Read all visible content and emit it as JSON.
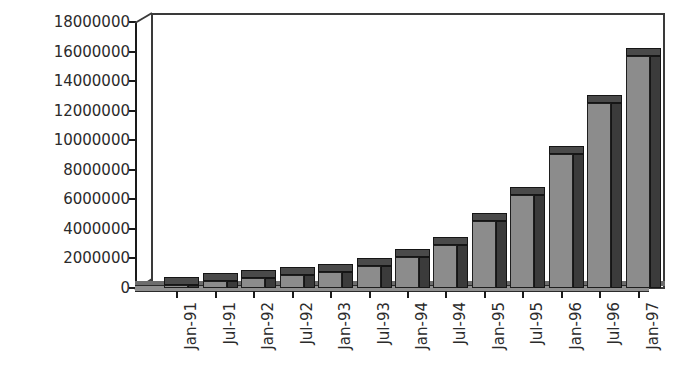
{
  "chart_data": {
    "type": "bar",
    "title": "",
    "subtitle": "",
    "xlabel": "",
    "ylabel": "",
    "categories": [
      "Jan-91",
      "Jul-91",
      "Jan-92",
      "Jul-92",
      "Jan-93",
      "Jul-93",
      "Jan-94",
      "Jul-94",
      "Jan-95",
      "Jul-95",
      "Jan-96",
      "Jul-96",
      "Jan-97"
    ],
    "values": [
      100000,
      500000,
      700000,
      900000,
      1100000,
      1500000,
      2100000,
      2900000,
      4500000,
      6300000,
      9100000,
      12500000,
      15700000
    ],
    "series": [
      {
        "name": "",
        "values": [
          100000,
          500000,
          700000,
          900000,
          1100000,
          1500000,
          2100000,
          2900000,
          4500000,
          6300000,
          9100000,
          12500000,
          15700000
        ]
      }
    ],
    "ylim": [
      0,
      18000000
    ],
    "yticks": [
      0,
      2000000,
      4000000,
      6000000,
      8000000,
      10000000,
      12000000,
      14000000,
      16000000,
      18000000
    ],
    "ytick_labels": [
      "0",
      "2000000",
      "4000000",
      "6000000",
      "8000000",
      "10000000",
      "12000000",
      "14000000",
      "16000000",
      "18000000"
    ],
    "grid": false,
    "legend": null,
    "legend_position": "none",
    "style": "3d-column",
    "colors": {
      "bar_front": "#8c8c8c",
      "bar_side": "#3b3b3b",
      "bar_top": "#4a4a4a",
      "axis": "#1a1a1a",
      "frame": "#3a3a3a",
      "text": "#2b2b2b",
      "background": "#ffffff",
      "floor_top": "#6d6d6d",
      "floor_front": "#8e8e8e"
    }
  }
}
